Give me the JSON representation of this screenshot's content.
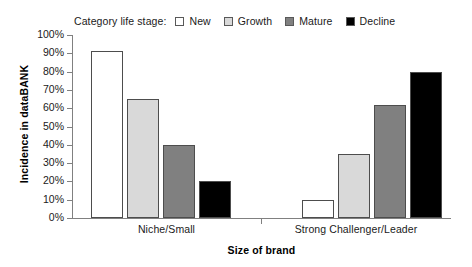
{
  "chart_data": {
    "type": "bar",
    "title": "",
    "xlabel": "Size of brand",
    "ylabel": "Incidence in dataBANK",
    "categories": [
      "Niche/Small",
      "Strong Challenger/Leader"
    ],
    "series": [
      {
        "name": "New",
        "values": [
          91,
          10
        ],
        "color": "#ffffff"
      },
      {
        "name": "Growth",
        "values": [
          65,
          35
        ],
        "color": "#d9d9d9"
      },
      {
        "name": "Mature",
        "values": [
          40,
          62
        ],
        "color": "#808080"
      },
      {
        "name": "Decline",
        "values": [
          20,
          80
        ],
        "color": "#000000"
      }
    ],
    "ylim": [
      0,
      100
    ],
    "ytick_labels": [
      "100%",
      "90%",
      "80%",
      "70%",
      "60%",
      "50%",
      "40%",
      "30%",
      "20%",
      "10%",
      "0%"
    ],
    "ytick_values": [
      100,
      90,
      80,
      70,
      60,
      50,
      40,
      30,
      20,
      10,
      0
    ],
    "grid": false,
    "legend_position": "top",
    "legend_title": "Category life stage:",
    "value_format": "percent"
  },
  "legend": {
    "title": "Category life stage:",
    "entries": [
      {
        "label": "New",
        "color": "#ffffff"
      },
      {
        "label": "Growth",
        "color": "#d9d9d9"
      },
      {
        "label": "Mature",
        "color": "#808080"
      },
      {
        "label": "Decline",
        "color": "#000000"
      }
    ]
  },
  "axes": {
    "y_title": "Incidence in dataBANK",
    "x_title": "Size of brand",
    "y_ticks": [
      "100%",
      "90%",
      "80%",
      "70%",
      "60%",
      "50%",
      "40%",
      "30%",
      "20%",
      "10%",
      "0%"
    ],
    "x_categories": [
      "Niche/Small",
      "Strong Challenger/Leader"
    ]
  },
  "style": {
    "axis_color": "#808080",
    "bar_border_color": "#4d4d4d",
    "text_color": "#1a1a1a",
    "background": "#ffffff"
  }
}
